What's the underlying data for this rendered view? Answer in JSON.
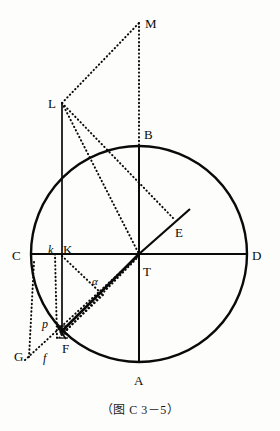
{
  "figure": {
    "caption": "（图 C 3－5）",
    "width": 280,
    "height": 431,
    "background_color": "#fdfdfb",
    "stroke_color": "#0a0a0a"
  },
  "circle": {
    "center": {
      "x": 139,
      "y": 254
    },
    "radius": 108,
    "stroke_width": 2.4,
    "style": "solid"
  },
  "points": {
    "A": {
      "x": 139,
      "y": 362,
      "label": "A",
      "label_x": 134,
      "label_y": 374,
      "style": "roman"
    },
    "B": {
      "x": 139,
      "y": 146,
      "label": "B",
      "label_x": 144,
      "label_y": 128,
      "style": "roman"
    },
    "C": {
      "x": 31,
      "y": 254,
      "label": "C",
      "label_x": 12,
      "label_y": 249,
      "style": "roman"
    },
    "D": {
      "x": 247,
      "y": 254,
      "label": "D",
      "label_x": 252,
      "label_y": 249,
      "style": "roman"
    },
    "T": {
      "x": 139,
      "y": 254,
      "label": "T",
      "label_x": 143,
      "label_y": 265,
      "style": "roman"
    },
    "E": {
      "x": 190,
      "y": 209,
      "label": "E",
      "label_x": 175,
      "label_y": 226,
      "style": "roman"
    },
    "K": {
      "x": 62,
      "y": 254,
      "label": "K",
      "label_x": 63,
      "label_y": 243,
      "style": "roman"
    },
    "k": {
      "x": 55,
      "y": 254,
      "label": "k",
      "label_x": 48,
      "label_y": 244,
      "style": "italic"
    },
    "L": {
      "x": 62,
      "y": 103,
      "label": "L",
      "label_x": 48,
      "label_y": 97,
      "style": "roman"
    },
    "M": {
      "x": 139,
      "y": 23,
      "label": "M",
      "label_x": 145,
      "label_y": 17,
      "style": "roman"
    },
    "F": {
      "x": 63,
      "y": 336,
      "label": "F",
      "label_x": 62,
      "label_y": 342,
      "style": "roman"
    },
    "f": {
      "x": 48,
      "y": 356,
      "label": "f",
      "label_x": 43,
      "label_y": 352,
      "style": "italic"
    },
    "G": {
      "x": 29,
      "y": 356,
      "label": "G",
      "label_x": 14,
      "label_y": 350,
      "style": "roman"
    },
    "p": {
      "x": 57,
      "y": 326,
      "label": "p",
      "label_x": 42,
      "label_y": 318,
      "style": "italic"
    },
    "alpha": {
      "x": 97,
      "y": 283,
      "label": "α",
      "label_x": 92,
      "label_y": 276,
      "style": "greek"
    }
  },
  "solid_lines": [
    {
      "name": "diameter-CD",
      "x1": 31,
      "y1": 254,
      "x2": 247,
      "y2": 254,
      "width": 2.0
    },
    {
      "name": "diameter-BA",
      "x1": 139,
      "y1": 146,
      "x2": 139,
      "y2": 362,
      "width": 2.0
    },
    {
      "name": "line-L-K-F",
      "x1": 62,
      "y1": 103,
      "x2": 62,
      "y2": 333,
      "width": 1.7
    },
    {
      "name": "ray-T-E",
      "x1": 139,
      "y1": 254,
      "x2": 190,
      "y2": 209,
      "width": 2.2
    },
    {
      "name": "chord-T-F",
      "x1": 139,
      "y1": 254,
      "x2": 60,
      "y2": 333,
      "width": 2.6
    },
    {
      "name": "segment-p-F-tick",
      "x1": 57,
      "y1": 326,
      "x2": 66,
      "y2": 339,
      "width": 1.6
    }
  ],
  "dotted_lines": [
    {
      "name": "dotted-L-M",
      "x1": 62,
      "y1": 103,
      "x2": 139,
      "y2": 23
    },
    {
      "name": "dotted-M-B",
      "x1": 139,
      "y1": 23,
      "x2": 139,
      "y2": 146
    },
    {
      "name": "dotted-L-T",
      "x1": 62,
      "y1": 103,
      "x2": 139,
      "y2": 254
    },
    {
      "name": "dotted-L-E",
      "x1": 62,
      "y1": 103,
      "x2": 173,
      "y2": 218
    },
    {
      "name": "dotted-k-vertical",
      "x1": 55,
      "y1": 254,
      "x2": 57,
      "y2": 338
    },
    {
      "name": "dotted-K-alpha-F",
      "x1": 62,
      "y1": 256,
      "x2": 103,
      "y2": 295
    },
    {
      "name": "dotted-alpha-F",
      "x1": 103,
      "y1": 295,
      "x2": 62,
      "y2": 334
    },
    {
      "name": "dotted-T-p-low",
      "x1": 139,
      "y1": 256,
      "x2": 58,
      "y2": 339
    },
    {
      "name": "dotted-C-G",
      "x1": 34,
      "y1": 262,
      "x2": 29,
      "y2": 357
    },
    {
      "name": "dotted-G-f-T",
      "x1": 25,
      "y1": 360,
      "x2": 139,
      "y2": 255
    }
  ],
  "tick_marks": {
    "name": "hatch-marks-near-F",
    "count": 4,
    "x": 60,
    "y_start": 326,
    "y_step": 4,
    "length": 8
  }
}
